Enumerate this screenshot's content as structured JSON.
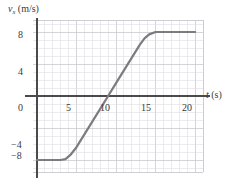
{
  "figure": {
    "background_color": "#ffffff",
    "curve_color": "#7b7b80",
    "axis_color": "#4a4a4a",
    "grid_color": "#c9c9cf",
    "grid_minor_color": "#dedee4"
  },
  "axis_titles": {
    "y_symbol": "v",
    "y_subscript": "x",
    "y_units": "(m/s)",
    "x_symbol": "t",
    "x_units": "(s)"
  },
  "ticks": {
    "x": [
      "5",
      "10",
      "15",
      "20"
    ],
    "y": [
      "8",
      "4",
      "0",
      "−4",
      "−8"
    ]
  },
  "chart_data": {
    "type": "line",
    "title": "",
    "xlabel": "t (s)",
    "ylabel": "v_x (m/s)",
    "xlim": [
      -1,
      22
    ],
    "ylim": [
      -10,
      10
    ],
    "xticks": [
      5,
      10,
      15,
      20
    ],
    "yticks": [
      -8,
      -4,
      0,
      4,
      8
    ],
    "grid": true,
    "grid_step_x": 1,
    "grid_step_y": 1,
    "legend": null,
    "series": [
      {
        "name": "v_x(t)",
        "color": "#7b7b80",
        "linewidth": 2.2,
        "x": [
          0,
          1,
          2,
          3,
          3.6,
          4.2,
          5,
          6,
          7,
          8,
          9,
          10,
          11,
          12,
          13,
          13.6,
          14.2,
          15,
          16,
          17,
          18,
          19,
          20
        ],
        "y": [
          -8,
          -8,
          -8,
          -8,
          -7.9,
          -7.4,
          -6.4,
          -4.8,
          -3.2,
          -1.6,
          0,
          1.6,
          3.2,
          4.8,
          6.4,
          7.2,
          7.7,
          8,
          8,
          8,
          8,
          8,
          8
        ]
      }
    ],
    "annotations": [
      {
        "text": "velocity constant at -8 m/s for t < ~3.5 s"
      },
      {
        "text": "linear increase, crosses zero at t = 9 s"
      },
      {
        "text": "velocity constant at +8 m/s for t > ~15 s"
      }
    ]
  }
}
